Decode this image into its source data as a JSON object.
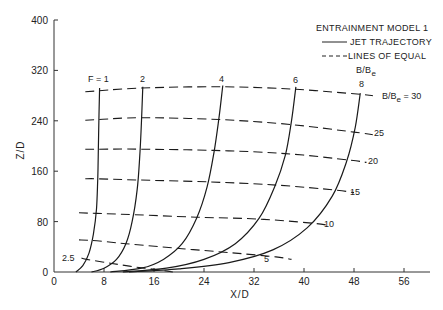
{
  "chart_data": {
    "type": "line",
    "title": "",
    "xlabel": "X/D",
    "ylabel": "Z/D",
    "xlim": [
      0,
      60
    ],
    "ylim": [
      0,
      400
    ],
    "xticks": [
      0,
      8,
      16,
      24,
      32,
      40,
      48,
      56
    ],
    "yticks": [
      0,
      80,
      160,
      240,
      320,
      400
    ],
    "grid": false,
    "legend": {
      "position": "upper right",
      "title": "ENTRAINMENT MODEL 1",
      "entries": [
        {
          "label": "JET TRAJECTORY",
          "style": "solid"
        },
        {
          "label": "LINES OF EQUAL B/Be",
          "style": "dashed"
        }
      ]
    },
    "series": [
      {
        "name": "F = 1",
        "style": "solid",
        "label": "F = 1",
        "points": [
          [
            3.5,
            0
          ],
          [
            4.6,
            10
          ],
          [
            5.6,
            30
          ],
          [
            6.3,
            60
          ],
          [
            6.8,
            100
          ],
          [
            7.0,
            150
          ],
          [
            7.1,
            200
          ],
          [
            7.2,
            250
          ],
          [
            7.3,
            292
          ]
        ]
      },
      {
        "name": "F = 2",
        "style": "solid",
        "label": "2",
        "points": [
          [
            6,
            0
          ],
          [
            8,
            6
          ],
          [
            10,
            20
          ],
          [
            11.5,
            45
          ],
          [
            12.5,
            80
          ],
          [
            13.3,
            130
          ],
          [
            13.7,
            180
          ],
          [
            14.0,
            240
          ],
          [
            14.2,
            294
          ]
        ]
      },
      {
        "name": "F = 4",
        "style": "solid",
        "label": "4",
        "points": [
          [
            9,
            0
          ],
          [
            14,
            6
          ],
          [
            17.5,
            20
          ],
          [
            20.5,
            45
          ],
          [
            22.8,
            85
          ],
          [
            24.5,
            135
          ],
          [
            25.6,
            190
          ],
          [
            26.4,
            245
          ],
          [
            27,
            296
          ]
        ]
      },
      {
        "name": "F = 6",
        "style": "solid",
        "label": "6",
        "points": [
          [
            11,
            0
          ],
          [
            18,
            6
          ],
          [
            24,
            20
          ],
          [
            29,
            45
          ],
          [
            32.8,
            85
          ],
          [
            35.3,
            135
          ],
          [
            37,
            185
          ],
          [
            38,
            240
          ],
          [
            38.7,
            294
          ]
        ]
      },
      {
        "name": "F = 8",
        "style": "solid",
        "label": "8",
        "points": [
          [
            12,
            0
          ],
          [
            20,
            5
          ],
          [
            28,
            15
          ],
          [
            35,
            35
          ],
          [
            40.5,
            70
          ],
          [
            44.5,
            120
          ],
          [
            46.8,
            175
          ],
          [
            48.2,
            230
          ],
          [
            49,
            284
          ]
        ]
      }
    ],
    "equal_b_lines": [
      {
        "name": "B/Be = 30",
        "label": "B/Be = 30",
        "style": "dashed",
        "points": [
          [
            5,
            286
          ],
          [
            14,
            292
          ],
          [
            27,
            294
          ],
          [
            38.7,
            290
          ],
          [
            49,
            282
          ],
          [
            51,
            280
          ]
        ]
      },
      {
        "name": "B/Be = 25",
        "label": "25",
        "style": "dashed",
        "points": [
          [
            5,
            241
          ],
          [
            7.2,
            242
          ],
          [
            14,
            245
          ],
          [
            26.4,
            242
          ],
          [
            38,
            234
          ],
          [
            48,
            222
          ],
          [
            51,
            218
          ]
        ]
      },
      {
        "name": "B/Be = 20",
        "label": "20",
        "style": "dashed",
        "points": [
          [
            5,
            195
          ],
          [
            7.1,
            195
          ],
          [
            13.8,
            195
          ],
          [
            25.6,
            193
          ],
          [
            37,
            188
          ],
          [
            47,
            178
          ],
          [
            50,
            174
          ]
        ]
      },
      {
        "name": "B/Be = 15",
        "label": "15",
        "style": "dashed",
        "points": [
          [
            5,
            148
          ],
          [
            7,
            148
          ],
          [
            13.5,
            146
          ],
          [
            24.8,
            143
          ],
          [
            35.6,
            138
          ],
          [
            45,
            130
          ],
          [
            48,
            126
          ]
        ]
      },
      {
        "name": "B/Be = 10",
        "label": "10",
        "style": "dashed",
        "points": [
          [
            4,
            94
          ],
          [
            6.8,
            93
          ],
          [
            12.8,
            91
          ],
          [
            22.8,
            87
          ],
          [
            32.8,
            84
          ],
          [
            40.8,
            78
          ],
          [
            44,
            74
          ]
        ]
      },
      {
        "name": "B/Be = 5",
        "label": "5",
        "style": "dashed",
        "points": [
          [
            4,
            51
          ],
          [
            6.2,
            50
          ],
          [
            11.5,
            45
          ],
          [
            20.5,
            37
          ],
          [
            29,
            30
          ],
          [
            35.5,
            24
          ],
          [
            38,
            20
          ]
        ]
      },
      {
        "name": "B/Be = 2.5",
        "label": "2.5",
        "style": "dashed",
        "points": [
          [
            4.4,
            22
          ],
          [
            5.2,
            20
          ],
          [
            9,
            14
          ],
          [
            13,
            8
          ],
          [
            17,
            3
          ],
          [
            19,
            0
          ]
        ]
      }
    ]
  },
  "axes": {
    "x_title": "X/D",
    "y_title": "Z/D",
    "x_ticks": [
      "0",
      "8",
      "16",
      "24",
      "32",
      "40",
      "48",
      "56"
    ],
    "y_ticks": [
      "0",
      "80",
      "160",
      "240",
      "320",
      "400"
    ]
  },
  "legend": {
    "title": "ENTRAINMENT MODEL 1",
    "solid_label": "JET TRAJECTORY",
    "dashed_label": "LINES OF EQUAL",
    "dashed_label_2": "B/B",
    "dashed_label_sub": "e"
  },
  "curve_labels": {
    "f1": "F = 1",
    "f2": "2",
    "f4": "4",
    "f6": "6",
    "f8": "8"
  },
  "b_labels": {
    "b30_prefix": "B/B",
    "b30_sub": "e",
    "b30_suffix": " = 30",
    "b25": "25",
    "b20": "20",
    "b15": "15",
    "b10": "10",
    "b5": "5",
    "b2_5": "2.5"
  }
}
